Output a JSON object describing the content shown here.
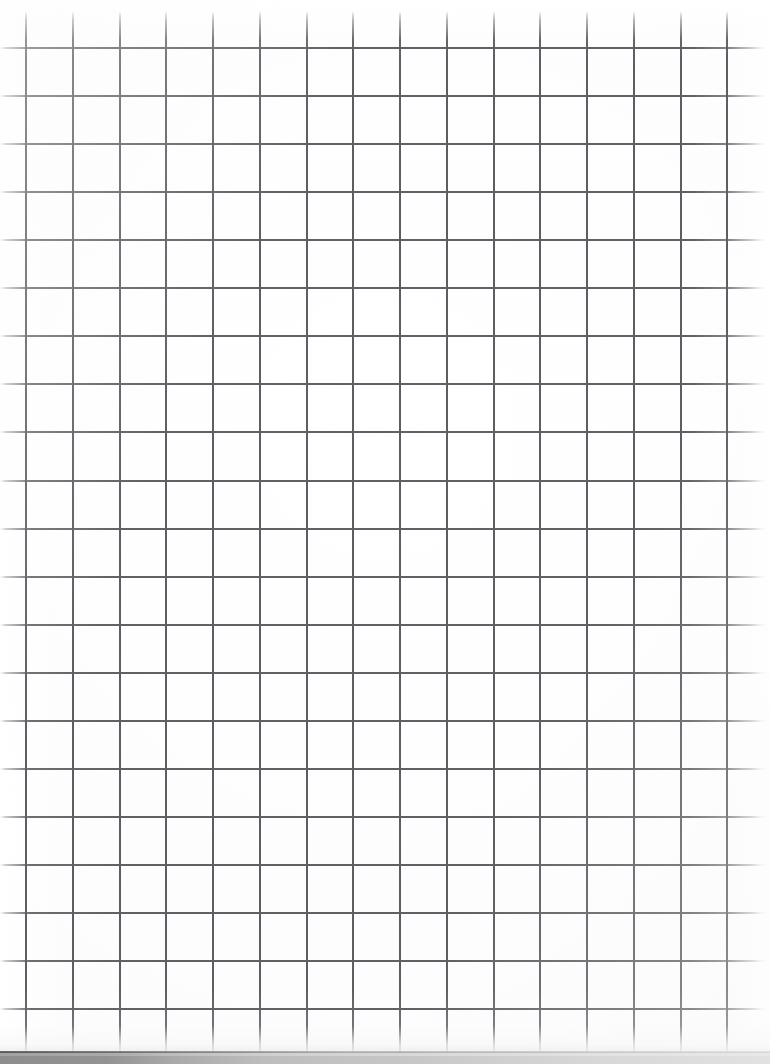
{
  "document": {
    "kind": "scanned-grid-paper",
    "title": "Blank squared notebook page",
    "width": 770,
    "height": 1064,
    "has_text": false,
    "has_writing": false,
    "description": "A blank scan of squared (graph) notebook paper. No text, numbers, headings or markings are present anywhere on the sheet."
  },
  "paper": {
    "background_color": "#fdfdfd",
    "edge_highlight_color": "#ffffff"
  },
  "grid": {
    "line_color": "#5c5e63",
    "line_width_px": 2,
    "vertical": {
      "count": 16,
      "first_x": 26,
      "spacing": 46.75,
      "fades_at_top": true,
      "positions": [
        26,
        72.8,
        119.5,
        166.3,
        213,
        259.8,
        306.5,
        353.3,
        400,
        446.8,
        493.5,
        540.3,
        587,
        633.8,
        680.5,
        727.3
      ]
    },
    "horizontal": {
      "count": 21,
      "first_y": 48,
      "spacing": 48.05,
      "fades_at_sides": true,
      "line_end_x": 766,
      "positions": [
        48,
        96.1,
        144.1,
        192.2,
        240.2,
        288.3,
        336.3,
        384.4,
        432.4,
        480.5,
        528.5,
        576.6,
        624.6,
        672.7,
        720.7,
        768.8,
        816.8,
        864.9,
        912.9,
        961,
        1009
      ]
    }
  },
  "bottom_edge": {
    "band_top_y": 1052,
    "band_height": 12,
    "color_left": "#8d8d8d",
    "color_right": "#d4d4d4",
    "description": "Grey shadow band along the cut bottom edge of the sheet, darker at the left and lightening toward the right."
  }
}
